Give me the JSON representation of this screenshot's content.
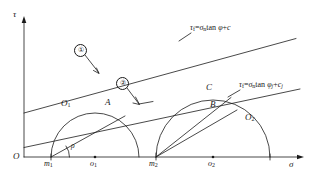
{
  "figure": {
    "axes": {
      "y_label": "τ",
      "x_label": "σ",
      "origin_label": "O"
    },
    "envelopes": [
      {
        "marker": "①",
        "equation_tau": "τ",
        "equation_tau_sub": "f",
        "equation_eq": "=",
        "equation_sigma": "σ",
        "equation_sigma_sub": "n",
        "equation_tan": "tan",
        "equation_phi": "φ",
        "equation_phi_sub": "",
        "equation_plus": "+",
        "equation_c": "c",
        "equation_c_sub": ""
      },
      {
        "marker": "②",
        "equation_tau": "τ",
        "equation_tau_sub": "f",
        "equation_eq": "=",
        "equation_sigma": "σ",
        "equation_sigma_sub": "n",
        "equation_tan": "tan",
        "equation_phi": "φ",
        "equation_phi_sub": "j",
        "equation_plus": "+",
        "equation_c": "c",
        "equation_c_sub": "j"
      }
    ],
    "points": {
      "circle1_label": "O",
      "circle1_sub": "1",
      "circle2_label": "O",
      "circle2_sub": "2",
      "point_a": "A",
      "point_b": "B",
      "point_c": "C",
      "m1": "m",
      "m1_sub": "1",
      "m2": "m",
      "m2_sub": "2",
      "o1": "o",
      "o1_sub": "1",
      "o2": "o",
      "o2_sub": "2",
      "angle_rho": "ρ"
    },
    "colors": {
      "stroke": "#1a1a1a",
      "background": "#ffffff"
    }
  }
}
